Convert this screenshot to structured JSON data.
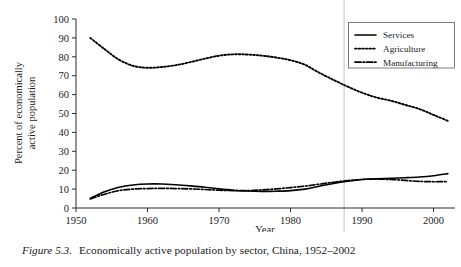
{
  "caption": {
    "figure_number": "Figure 5.3.",
    "text": "Economically active population by sector, China, 1952–2002"
  },
  "axes": {
    "xlabel": "Year",
    "ylabel_line1": "Percent of economically",
    "ylabel_line2": "active population",
    "xticks": [
      "1950",
      "1960",
      "1970",
      "1980",
      "1990",
      "2000"
    ],
    "yticks": [
      "0",
      "10",
      "20",
      "30",
      "40",
      "50",
      "60",
      "70",
      "80",
      "90",
      "100"
    ]
  },
  "legend": {
    "items": [
      {
        "label": "Services",
        "style": "solid",
        "color": "#000000"
      },
      {
        "label": "Agriculture",
        "style": "dotted",
        "color": "#000000"
      },
      {
        "label": "Manufacturing",
        "style": "dashdot",
        "color": "#000000"
      }
    ]
  },
  "annotations": {
    "page_fold_line_year": 1987.5,
    "page_fold_color": "#d9d9d9"
  },
  "chart_data": {
    "type": "line",
    "title": "",
    "xlabel": "Year",
    "ylabel": "Percent of economically active population",
    "xlim": [
      1950,
      2003
    ],
    "ylim": [
      0,
      100
    ],
    "xticks": [
      1950,
      1960,
      1970,
      1980,
      1990,
      2000
    ],
    "yticks": [
      0,
      10,
      20,
      30,
      40,
      50,
      60,
      70,
      80,
      90,
      100
    ],
    "grid": false,
    "legend_position": "top-right",
    "x": [
      1952,
      1954,
      1956,
      1958,
      1960,
      1962,
      1964,
      1966,
      1968,
      1970,
      1972,
      1974,
      1976,
      1978,
      1980,
      1982,
      1984,
      1986,
      1988,
      1990,
      1992,
      1994,
      1996,
      1998,
      2000,
      2002
    ],
    "series": [
      {
        "name": "Agriculture",
        "style": "dotted",
        "color": "#000000",
        "values": [
          90.0,
          84.0,
          78.5,
          75.2,
          74.2,
          74.6,
          75.6,
          77.2,
          79.0,
          80.6,
          81.3,
          81.2,
          80.6,
          79.6,
          78.2,
          75.8,
          71.6,
          67.8,
          64.2,
          61.0,
          58.5,
          56.8,
          54.6,
          52.4,
          49.3,
          46.1
        ]
      },
      {
        "name": "Services",
        "style": "solid",
        "color": "#000000",
        "values": [
          5.1,
          8.6,
          11.0,
          12.2,
          12.7,
          12.7,
          12.3,
          11.7,
          11.0,
          10.1,
          9.4,
          9.0,
          8.8,
          8.9,
          9.2,
          10.0,
          11.5,
          13.0,
          14.2,
          15.1,
          15.5,
          15.7,
          16.0,
          16.4,
          17.1,
          18.2
        ]
      },
      {
        "name": "Manufacturing",
        "style": "dashdot",
        "color": "#000000",
        "values": [
          4.8,
          7.3,
          9.2,
          10.0,
          10.3,
          10.4,
          10.3,
          10.1,
          9.8,
          9.4,
          9.2,
          9.2,
          9.6,
          10.1,
          10.8,
          11.6,
          12.6,
          13.6,
          14.5,
          15.1,
          15.3,
          15.1,
          14.6,
          14.1,
          13.9,
          14.0
        ]
      }
    ]
  }
}
